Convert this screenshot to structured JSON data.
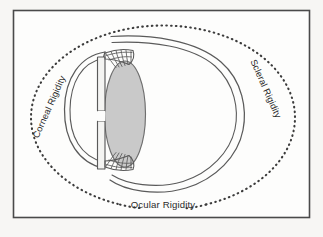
{
  "figure": {
    "title": "Ocular rigidity schematic of the human eye",
    "frame": {
      "border_color": "#4a4a4a",
      "background_color": "#fdfdfc",
      "page_margin_color": "#f6f5f3"
    },
    "labels": {
      "corneal": "Corneal Rigidity",
      "scleral": "Scleral Rigidity",
      "ocular": "Ocular Rigidity"
    },
    "colors": {
      "outline": "#5a5a5a",
      "lens_fill": "#c9c9c9",
      "lens_stroke": "#6e6e6e",
      "dotted_ellipse": "#3c3c3c",
      "iris_fill": "#f2f2f0",
      "text": "#2b2b2b"
    },
    "parts": [
      {
        "name": "ocular-rigidity-dotted-ellipse",
        "description": "Dotted ellipse enclosing the whole eye"
      },
      {
        "name": "sclera-globe",
        "description": "Double-contour posterior globe wall"
      },
      {
        "name": "cornea",
        "description": "Double-contour anterior corneal bulge"
      },
      {
        "name": "iris-upper",
        "description": "Upper iris leaf"
      },
      {
        "name": "iris-lower",
        "description": "Lower iris leaf"
      },
      {
        "name": "pupil-gap",
        "description": "Central aperture between iris leaves"
      },
      {
        "name": "lens",
        "description": "Shaded crystalline lens"
      },
      {
        "name": "ciliary-zonules-upper",
        "description": "Upper ciliary body with zonular fibers"
      },
      {
        "name": "ciliary-zonules-lower",
        "description": "Lower ciliary body with zonular fibers"
      }
    ]
  }
}
